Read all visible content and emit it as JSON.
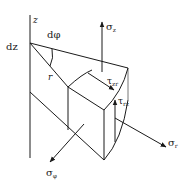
{
  "diagram": {
    "type": "stress-element-cylindrical-coordinates",
    "colors": {
      "line": "#1a1a1a",
      "background": "#ffffff"
    },
    "labels": {
      "z_axis": "z",
      "dz": "dz",
      "dphi": "dφ",
      "r": "r",
      "sigma_z": {
        "main": "σ",
        "sub": "z"
      },
      "tau_zr": {
        "main": "τ",
        "sub": "zr"
      },
      "tau_rz": {
        "main": "τ",
        "sub": "rz"
      },
      "sigma_r": {
        "main": "σ",
        "sub": "r"
      },
      "sigma_phi": {
        "main": "σ",
        "sub": "φ"
      }
    }
  }
}
